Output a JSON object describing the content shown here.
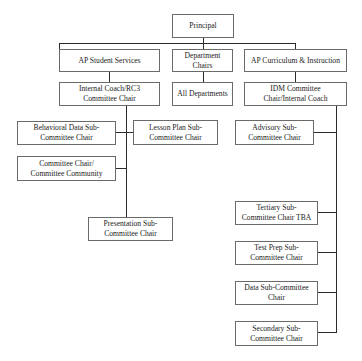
{
  "chart": {
    "nodes": {
      "principal": "Principal",
      "ap_student_services": "AP Student Services",
      "department_chairs": "Department\nChairs",
      "ap_curriculum": "AP Curriculum & Instruction",
      "internal_coach": "Internal Coach/RC3\nCommittee Chair",
      "all_departments": "All Departments",
      "idm_committee": "IDM Committee\nChair/Internal Coach",
      "behavioral_data": "Behavioral Data Sub-\nCommittee Chair",
      "lesson_plan": "Lesson Plan Sub-\nCommittee Chair",
      "committee_chair": "Committee Chair/\nCommittee Community",
      "presentation": "Presentation Sub-\nCommittee Chair",
      "advisory": "Advisory Sub-\nCommittee Chair",
      "tertiary": "Tertiary Sub-\nCommittee Chair TBA",
      "test_prep": "Test Prep Sub-\nCommittee Chair",
      "data_sub": "Data Sub-Committee\nChair",
      "secondary": "Secondary Sub-\nCommittee Chair"
    },
    "hierarchy": {
      "Principal": [
        "AP Student Services",
        "Department Chairs",
        "AP Curriculum & Instruction"
      ],
      "AP Student Services": [
        "Internal Coach/RC3 Committee Chair"
      ],
      "Department Chairs": [
        "All Departments"
      ],
      "AP Curriculum & Instruction": [
        "IDM Committee Chair/Internal Coach"
      ],
      "Internal Coach/RC3 Committee Chair": [
        "Behavioral Data Sub-Committee Chair",
        "Lesson Plan Sub-Committee Chair",
        "Committee Chair/Committee Community",
        "Presentation Sub-Committee Chair"
      ],
      "IDM Committee Chair/Internal Coach": [
        "Advisory Sub-Committee Chair",
        "Tertiary Sub-Committee Chair TBA",
        "Test Prep Sub-Committee Chair",
        "Data Sub-Committee Chair",
        "Secondary Sub-Committee Chair"
      ]
    },
    "colors": {
      "border": "#6a6a6a",
      "line": "#2b2b2b",
      "background": "#ffffff",
      "text": "#222222"
    }
  }
}
